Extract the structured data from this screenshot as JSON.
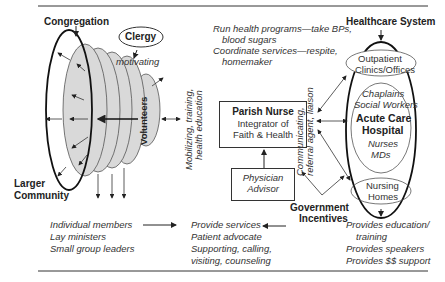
{
  "title_lines": {
    "top": true,
    "bottom": true
  },
  "left": {
    "congregation_label": "Congregation",
    "larger_community_line1": "Larger",
    "larger_community_line2": "Community",
    "clergy_label": "Clergy",
    "motivating_label": "motivating",
    "volunteers_label": "Volunteers",
    "mobilizing_line1": "Mobilizing, training,",
    "mobilizing_line2": "health education"
  },
  "center": {
    "activities": [
      "Run health programs—take BPs,",
      "blood sugars",
      "Coordinate services—respite,",
      "homemaker"
    ],
    "parish_nurse": {
      "title": "Parish Nurse",
      "line2": "Integrator of",
      "line3": "Faith & Health"
    },
    "physician_advisor": {
      "line1": "Physician",
      "line2": "Advisor"
    },
    "communicating_line1": "Communicating,",
    "communicating_line2": "referral agent, liaison",
    "government_line1": "Government",
    "government_line2": "Incentives"
  },
  "right": {
    "healthcare_label": "Healthcare System",
    "outpatient_line1": "Outpatient",
    "outpatient_line2": "Clinics/Offices",
    "chaplains": "Chaplains",
    "social_workers": "Social Workers",
    "acute_line1": "Acute Care",
    "acute_line2": "Hospital",
    "nurses": "Nurses",
    "mds": "MDs",
    "nursing_line1": "Nursing",
    "nursing_line2": "Homes"
  },
  "bottom": {
    "members": [
      "Individual members",
      "Lay ministers",
      "Small group leaders"
    ],
    "services": [
      "Provide services",
      "Patient advocate",
      "Supporting, calling,",
      "visiting, counseling"
    ],
    "provides": [
      "Provides education/",
      "training",
      "Provides speakers",
      "Provides $$ support"
    ]
  },
  "colors": {
    "line": "#222222",
    "volunteer_fill": "#d9d9d9",
    "volunteer_stroke": "#555555"
  }
}
